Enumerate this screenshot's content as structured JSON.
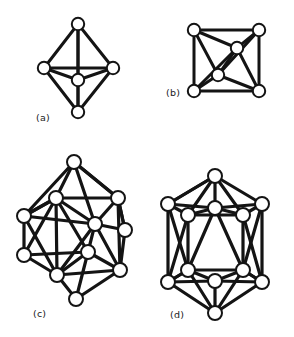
{
  "figure": {
    "background_color": "#ffffff",
    "ink_color": "#141414",
    "node_fill_color": "#ffffff",
    "width": 294,
    "height": 337,
    "panels": [
      {
        "id": "a",
        "label": "(a)",
        "label_x": 36,
        "label_y": 121,
        "shape_name": "octahedron",
        "node_radius": 6.2,
        "edge_width": 3.0,
        "node_stroke_width": 2.0,
        "nodes": [
          {
            "name": "apex-top",
            "x": 78,
            "y": 24
          },
          {
            "name": "equator-left",
            "x": 44,
            "y": 68
          },
          {
            "name": "equator-right",
            "x": 113,
            "y": 68
          },
          {
            "name": "equator-front",
            "x": 78,
            "y": 80
          },
          {
            "name": "apex-bottom",
            "x": 78,
            "y": 112
          }
        ],
        "edges": [
          [
            0,
            1
          ],
          [
            0,
            2
          ],
          [
            0,
            3
          ],
          [
            0,
            4
          ],
          [
            1,
            2
          ],
          [
            1,
            3
          ],
          [
            1,
            4
          ],
          [
            2,
            3
          ],
          [
            2,
            4
          ],
          [
            3,
            4
          ]
        ]
      },
      {
        "id": "b",
        "label": "(b)",
        "label_x": 166,
        "label_y": 96,
        "shape_name": "tetrahedron-in-square",
        "node_radius": 6.2,
        "edge_width": 3.0,
        "node_stroke_width": 2.0,
        "nodes": [
          {
            "name": "corner-top-left",
            "x": 194,
            "y": 30
          },
          {
            "name": "corner-top-right",
            "x": 259,
            "y": 30
          },
          {
            "name": "corner-bottom-left",
            "x": 194,
            "y": 91
          },
          {
            "name": "corner-bottom-right",
            "x": 259,
            "y": 91
          },
          {
            "name": "inner-upper",
            "x": 237,
            "y": 48
          },
          {
            "name": "inner-lower",
            "x": 218,
            "y": 75
          }
        ],
        "edges": [
          [
            0,
            1
          ],
          [
            1,
            3
          ],
          [
            3,
            2
          ],
          [
            2,
            0
          ],
          [
            0,
            4
          ],
          [
            1,
            4
          ],
          [
            2,
            4
          ],
          [
            3,
            4
          ],
          [
            0,
            5
          ],
          [
            1,
            5
          ],
          [
            2,
            5
          ],
          [
            3,
            5
          ],
          [
            4,
            5
          ]
        ]
      },
      {
        "id": "c",
        "label": "(c)",
        "label_x": 33,
        "label_y": 317,
        "shape_name": "thirteen-vertex-cluster",
        "node_radius": 7.0,
        "edge_width": 3.2,
        "node_stroke_width": 2.0,
        "nodes": [
          {
            "name": "apex-top",
            "x": 74,
            "y": 162
          },
          {
            "name": "upper-left",
            "x": 56,
            "y": 198
          },
          {
            "name": "upper-right",
            "x": 118,
            "y": 198
          },
          {
            "name": "mid-far-left",
            "x": 24,
            "y": 216
          },
          {
            "name": "mid-center",
            "x": 95,
            "y": 224
          },
          {
            "name": "mid-right-edge",
            "x": 125,
            "y": 230
          },
          {
            "name": "low-mid-center",
            "x": 88,
            "y": 252
          },
          {
            "name": "low-far-left",
            "x": 24,
            "y": 255
          },
          {
            "name": "low-left",
            "x": 57,
            "y": 275
          },
          {
            "name": "low-right",
            "x": 120,
            "y": 270
          },
          {
            "name": "apex-bottom",
            "x": 76,
            "y": 299
          }
        ],
        "edges": [
          [
            0,
            1
          ],
          [
            0,
            2
          ],
          [
            0,
            3
          ],
          [
            0,
            4
          ],
          [
            1,
            2
          ],
          [
            1,
            3
          ],
          [
            1,
            4
          ],
          [
            1,
            6
          ],
          [
            1,
            7
          ],
          [
            1,
            8
          ],
          [
            2,
            4
          ],
          [
            2,
            5
          ],
          [
            2,
            9
          ],
          [
            3,
            1
          ],
          [
            3,
            7
          ],
          [
            3,
            4
          ],
          [
            3,
            8
          ],
          [
            4,
            5
          ],
          [
            4,
            6
          ],
          [
            4,
            9
          ],
          [
            4,
            8
          ],
          [
            5,
            9
          ],
          [
            6,
            8
          ],
          [
            6,
            9
          ],
          [
            6,
            10
          ],
          [
            6,
            7
          ],
          [
            7,
            8
          ],
          [
            8,
            10
          ],
          [
            8,
            9
          ],
          [
            9,
            10
          ],
          [
            2,
            0
          ],
          [
            5,
            2
          ]
        ]
      },
      {
        "id": "d",
        "label": "(d)",
        "label_x": 170,
        "label_y": 318,
        "shape_name": "icosahedron",
        "node_radius": 7.0,
        "edge_width": 3.2,
        "node_stroke_width": 2.0,
        "nodes": [
          {
            "name": "apex-top",
            "x": 215,
            "y": 176
          },
          {
            "name": "upper-inner",
            "x": 215,
            "y": 208
          },
          {
            "name": "upper-left-outer",
            "x": 168,
            "y": 204
          },
          {
            "name": "upper-right-outer",
            "x": 262,
            "y": 204
          },
          {
            "name": "upper-left-inner",
            "x": 188,
            "y": 215
          },
          {
            "name": "upper-right-inner",
            "x": 243,
            "y": 215
          },
          {
            "name": "lower-left-inner",
            "x": 188,
            "y": 270
          },
          {
            "name": "lower-right-inner",
            "x": 243,
            "y": 270
          },
          {
            "name": "lower-left-outer",
            "x": 168,
            "y": 282
          },
          {
            "name": "lower-right-outer",
            "x": 262,
            "y": 282
          },
          {
            "name": "lower-inner",
            "x": 215,
            "y": 281
          },
          {
            "name": "apex-bottom",
            "x": 215,
            "y": 313
          }
        ],
        "edges": [
          [
            0,
            1
          ],
          [
            0,
            2
          ],
          [
            0,
            3
          ],
          [
            0,
            4
          ],
          [
            0,
            5
          ],
          [
            1,
            4
          ],
          [
            1,
            5
          ],
          [
            1,
            6
          ],
          [
            1,
            7
          ],
          [
            2,
            4
          ],
          [
            2,
            8
          ],
          [
            2,
            6
          ],
          [
            2,
            0
          ],
          [
            3,
            5
          ],
          [
            3,
            9
          ],
          [
            3,
            7
          ],
          [
            4,
            5
          ],
          [
            4,
            6
          ],
          [
            4,
            8
          ],
          [
            5,
            7
          ],
          [
            5,
            9
          ],
          [
            6,
            7
          ],
          [
            6,
            8
          ],
          [
            6,
            10
          ],
          [
            7,
            9
          ],
          [
            7,
            10
          ],
          [
            8,
            10
          ],
          [
            8,
            11
          ],
          [
            9,
            10
          ],
          [
            9,
            11
          ],
          [
            10,
            11
          ],
          [
            8,
            6
          ],
          [
            9,
            7
          ],
          [
            2,
            1
          ],
          [
            3,
            1
          ],
          [
            11,
            6
          ],
          [
            11,
            7
          ]
        ]
      }
    ]
  }
}
